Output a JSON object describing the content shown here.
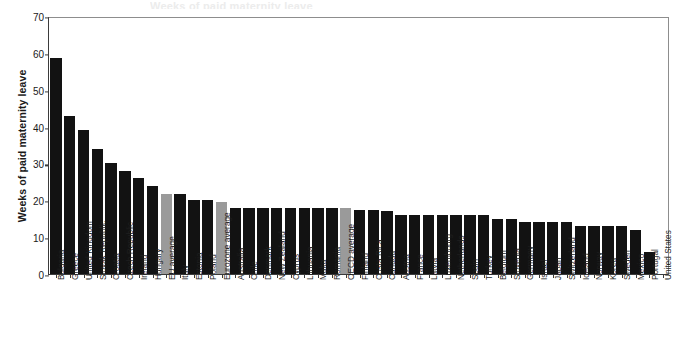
{
  "figure": {
    "clipped_title": "Weeks of paid maternity leave",
    "ylabel": "Weeks of paid maternity leave",
    "bar_color": "#121212",
    "highlight_color": "#9a9a9a"
  },
  "chart_data": {
    "type": "bar",
    "title": "",
    "xlabel": "",
    "ylabel": "Weeks of paid maternity leave",
    "ylim": [
      0,
      70
    ],
    "yticks": [
      0,
      10,
      20,
      30,
      40,
      50,
      60,
      70
    ],
    "grid": false,
    "legend": "none",
    "highlight_categories": [
      "EU average",
      "Eurozone average",
      "OECD average"
    ],
    "categories": [
      "Bulgaria",
      "Greece",
      "United Kingdom",
      "Slovak Republic",
      "Croatia",
      "Czech Republic",
      "Ireland",
      "Hungary",
      "EU average",
      "Italy",
      "Estonia",
      "Poland",
      "Eurozone average",
      "Australia",
      "Chile",
      "Denmark",
      "New Zealand",
      "Cyprus",
      "Lithuania",
      "Malta",
      "Romania",
      "OECD average",
      "Finland",
      "Costa Rica",
      "Canada",
      "Austria",
      "France",
      "Latvia",
      "Luxembourg",
      "Netherlands",
      "Spain",
      "Turkey",
      "Belgium",
      "Slovenia",
      "Germany",
      "Israel",
      "Japan",
      "Switzerland",
      "Iceland",
      "Norway",
      "Korea",
      "Sweden",
      "Mexico",
      "Portugal",
      "United States"
    ],
    "values": [
      58.6,
      43.0,
      39.0,
      34.0,
      30.0,
      28.0,
      26.0,
      24.0,
      21.8,
      21.7,
      20.0,
      20.0,
      19.5,
      18.0,
      18.0,
      18.0,
      18.0,
      18.0,
      18.0,
      18.0,
      18.0,
      18.0,
      17.5,
      17.4,
      17.0,
      16.0,
      16.0,
      16.0,
      16.0,
      16.0,
      16.0,
      16.0,
      15.0,
      15.0,
      14.0,
      14.0,
      14.0,
      14.0,
      13.0,
      13.0,
      12.9,
      12.9,
      12.0,
      6.0,
      0.0
    ]
  }
}
